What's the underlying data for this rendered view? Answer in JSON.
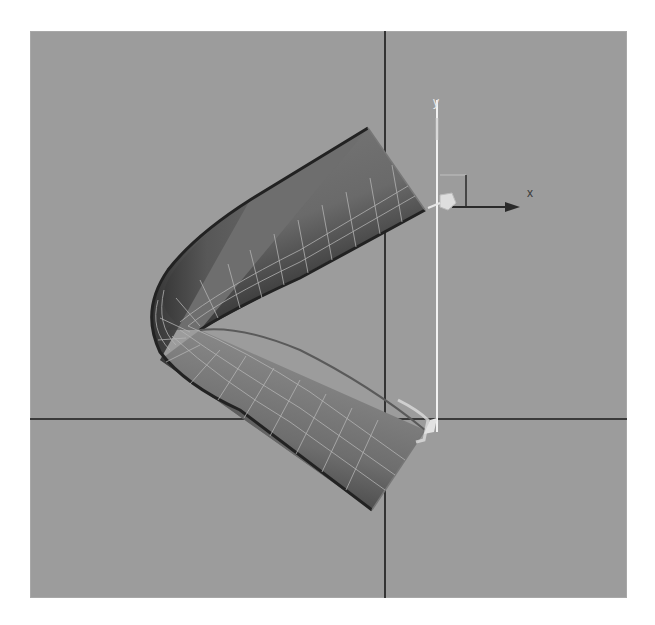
{
  "viewport": {
    "name": "3D modeling viewport - Front view",
    "background": "#9c9c9c",
    "grid_axes": {
      "vertical_axis_x": 385,
      "horizontal_axis_y": 419,
      "color": "#1a1a1a"
    }
  },
  "gizmo": {
    "x_label": "x",
    "y_label": "y",
    "y_axis_color": "#f2f2f2",
    "x_axis_color": "#2a2a2a"
  },
  "object": {
    "type": "bent tube / pipe mesh",
    "shade_light": "#8a8a8a",
    "shade_dark": "#2c2c2c",
    "wire_color": "#b8b8b8"
  }
}
